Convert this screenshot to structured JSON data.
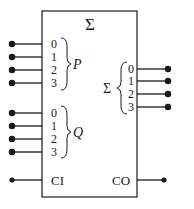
{
  "block": {
    "title": "Σ",
    "inputs_p": {
      "name": "P",
      "bits": [
        "0",
        "1",
        "2",
        "3"
      ]
    },
    "inputs_q": {
      "name": "Q",
      "bits": [
        "0",
        "1",
        "2",
        "3"
      ]
    },
    "outputs_sum": {
      "name": "Σ",
      "bits": [
        "0",
        "1",
        "2",
        "3"
      ]
    },
    "carry_in": "CI",
    "carry_out": "CO"
  },
  "colors": {
    "line": "#1a1a1a",
    "background": "#ffffff"
  }
}
